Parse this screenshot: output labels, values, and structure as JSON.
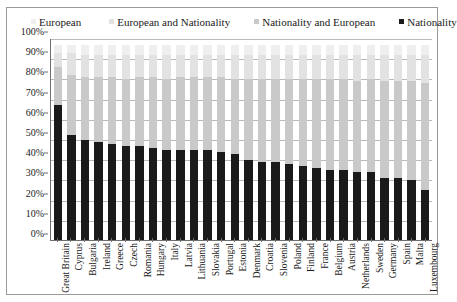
{
  "legend": {
    "items": [
      {
        "label": "European",
        "color": "#efefef",
        "marker": "square-swatch-icon"
      },
      {
        "label": "European and Nationality",
        "color": "#e2e2e2",
        "marker": "square-swatch-icon"
      },
      {
        "label": "Nationality and European",
        "color": "#c9c9c9",
        "marker": "square-swatch-icon"
      },
      {
        "label": "Nationality",
        "color": "#1a1a1a",
        "marker": "square-swatch-icon"
      }
    ]
  },
  "axes": {
    "y_ticks": [
      "100%",
      "90%",
      "80%",
      "70%",
      "60%",
      "50%",
      "40%",
      "30%",
      "20%",
      "10%",
      "0%"
    ],
    "y_min": 0,
    "y_max": 100,
    "y_step": 10
  },
  "chart_data": {
    "type": "bar",
    "subtype": "stacked-column",
    "title": "",
    "xlabel": "",
    "ylabel": "",
    "ylim": [
      0,
      100
    ],
    "grid": true,
    "legend_position": "top",
    "categories": [
      "Great Britain",
      "Cyprus",
      "Bulgaria",
      "Ireland",
      "Greece",
      "Czech",
      "Romania",
      "Hungary",
      "Italy",
      "Latvia",
      "Lithuania",
      "Slovakia",
      "Portugal",
      "Estonia",
      "Denmark",
      "Croatia",
      "Slovenia",
      "Poland",
      "Finland",
      "France",
      "Belgium",
      "Austria",
      "Netherlands",
      "Sweden",
      "Germany",
      "Spain",
      "Malta",
      "Luxembourg"
    ],
    "series": [
      {
        "name": "Nationality",
        "color": "#1a1a1a",
        "values": [
          67,
          52,
          50,
          49,
          48,
          47,
          47,
          46,
          45,
          45,
          45,
          45,
          44,
          43,
          40,
          39,
          39,
          38,
          37,
          36,
          35,
          35,
          34,
          34,
          31,
          31,
          30,
          25
        ]
      },
      {
        "name": "Nationality and European",
        "color": "#c9c9c9",
        "values": [
          19,
          30,
          31,
          32,
          33,
          33,
          34,
          35,
          35,
          36,
          36,
          36,
          37,
          37,
          40,
          41,
          41,
          42,
          43,
          44,
          45,
          45,
          45,
          46,
          48,
          48,
          49,
          53
        ]
      },
      {
        "name": "European and Nationality",
        "color": "#e2e2e2",
        "values": [
          7,
          11,
          11,
          11,
          11,
          12,
          11,
          11,
          12,
          11,
          11,
          11,
          11,
          12,
          12,
          12,
          12,
          12,
          12,
          12,
          12,
          12,
          13,
          12,
          13,
          13,
          13,
          14
        ]
      },
      {
        "name": "European",
        "color": "#efefef",
        "values": [
          4,
          4,
          5,
          5,
          5,
          5,
          5,
          5,
          5,
          5,
          5,
          5,
          5,
          5,
          5,
          5,
          5,
          5,
          5,
          5,
          5,
          5,
          5,
          5,
          5,
          5,
          5,
          5
        ]
      }
    ]
  }
}
